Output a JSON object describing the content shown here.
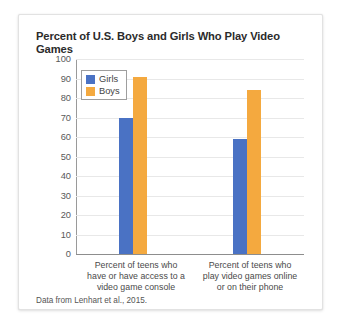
{
  "chart_data": {
    "type": "bar",
    "title": "Percent of U.S. Boys and Girls Who Play Video Games",
    "xlabel": "",
    "ylabel": "",
    "ylim": [
      0,
      100
    ],
    "ytick_step": 10,
    "yticks": [
      100,
      90,
      80,
      70,
      60,
      50,
      40,
      30,
      20,
      10,
      0
    ],
    "grid": true,
    "legend_position": "top-left inside plot",
    "categories": [
      "Percent of teens who have or have access to a video game console",
      "Percent of teens who play video games online or on their phone"
    ],
    "category_lines": [
      [
        "Percent of teens who",
        "have or have access to a",
        "video game console"
      ],
      [
        "Percent of teens who",
        "play video games online",
        "or on their phone"
      ]
    ],
    "series": [
      {
        "name": "Girls",
        "color": "#4a72c4",
        "values": [
          70,
          59
        ]
      },
      {
        "name": "Boys",
        "color": "#f4a93f",
        "values": [
          91,
          84
        ]
      }
    ],
    "source_note": "Data from Lenhart et al., 2015."
  }
}
